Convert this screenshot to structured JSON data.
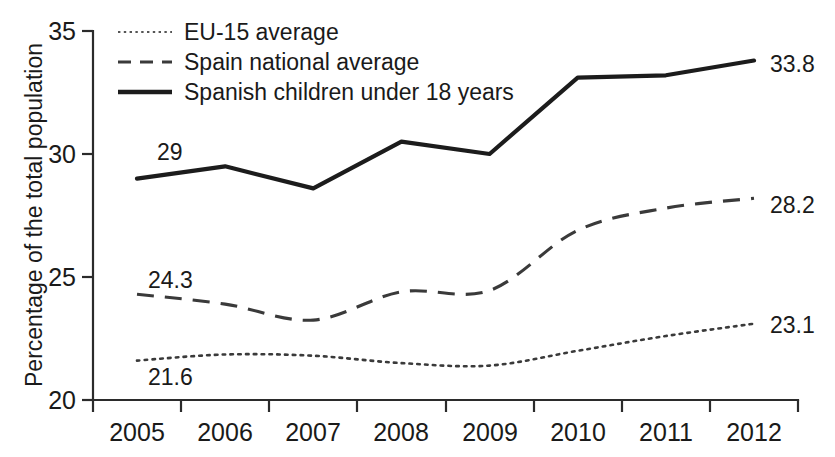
{
  "chart_data": {
    "type": "line",
    "title": "",
    "xlabel": "",
    "ylabel": "Percentage of the total population",
    "categories": [
      "2005",
      "2006",
      "2007",
      "2008",
      "2009",
      "2010",
      "2011",
      "2012"
    ],
    "x": [
      2005,
      2006,
      2007,
      2008,
      2009,
      2010,
      2011,
      2012
    ],
    "ylim": [
      20,
      35
    ],
    "yticks": [
      "20",
      "25",
      "30",
      "35"
    ],
    "ytick_values": [
      20,
      25,
      30,
      35
    ],
    "grid": false,
    "legend_position": "top-left inside plot",
    "series": [
      {
        "name": "EU-15 average",
        "style": "dotted",
        "values": [
          21.6,
          21.85,
          21.8,
          21.5,
          21.4,
          22.0,
          22.6,
          23.1
        ],
        "start_label": "21.6",
        "end_label": "23.1"
      },
      {
        "name": "Spain national average",
        "style": "dashed",
        "values": [
          24.3,
          23.9,
          23.25,
          24.4,
          24.45,
          26.9,
          27.8,
          28.2
        ],
        "start_label": "24.3",
        "end_label": "28.2"
      },
      {
        "name": "Spanish children under 18 years",
        "style": "solid",
        "values": [
          29.0,
          29.5,
          28.6,
          30.5,
          30.0,
          33.1,
          33.2,
          33.8
        ],
        "start_label": "29",
        "end_label": "33.8"
      }
    ],
    "annotations": [
      {
        "text": "29",
        "series": "Spanish children under 18 years",
        "at": "2005"
      },
      {
        "text": "33.8",
        "series": "Spanish children under 18 years",
        "at": "2012"
      },
      {
        "text": "24.3",
        "series": "Spain national average",
        "at": "2005"
      },
      {
        "text": "28.2",
        "series": "Spain national average",
        "at": "2012"
      },
      {
        "text": "21.6",
        "series": "EU-15 average",
        "at": "2005"
      },
      {
        "text": "23.1",
        "series": "EU-15 average",
        "at": "2012"
      }
    ],
    "colors": {
      "axis": "#2b2b2b",
      "solid_series": "#1c1c1c",
      "dashed_series": "#3a3a3a",
      "dotted_series": "#3a3a3a",
      "background": "#ffffff"
    }
  },
  "legend": {
    "items": [
      {
        "label": "EU-15 average",
        "style": "dotted"
      },
      {
        "label": "Spain national average",
        "style": "dashed"
      },
      {
        "label": "Spanish children under 18 years",
        "style": "solid"
      }
    ]
  },
  "axes": {
    "y_title": "Percentage of the total population",
    "y_ticks": [
      {
        "label": "35"
      },
      {
        "label": "30"
      },
      {
        "label": "25"
      },
      {
        "label": "20"
      }
    ],
    "x_ticks": [
      {
        "label": "2005"
      },
      {
        "label": "2006"
      },
      {
        "label": "2007"
      },
      {
        "label": "2008"
      },
      {
        "label": "2009"
      },
      {
        "label": "2010"
      },
      {
        "label": "2011"
      },
      {
        "label": "2012"
      }
    ]
  },
  "labels": {
    "children_start": "29",
    "children_end": "33.8",
    "spain_start": "24.3",
    "spain_end": "28.2",
    "eu_start": "21.6",
    "eu_end": "23.1"
  }
}
